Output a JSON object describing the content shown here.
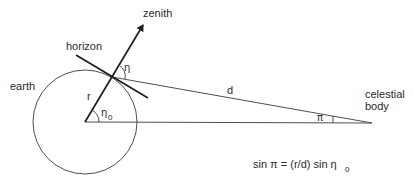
{
  "diagram": {
    "labels": {
      "zenith": "zenith",
      "horizon": "horizon",
      "earth": "earth",
      "radius": "r",
      "distance": "d",
      "celestial_body_line1": "celestial",
      "celestial_body_line2": "body",
      "angle_eta": "η",
      "angle_eta0_base": "η",
      "angle_eta0_sub": "0",
      "angle_pi": "π"
    },
    "formula": {
      "lhs": "sin π = (r/d) sin η",
      "sub": "0"
    },
    "colors": {
      "line": "#1e1e1e",
      "text": "#2a2a2a",
      "background": "#ffffff"
    }
  }
}
